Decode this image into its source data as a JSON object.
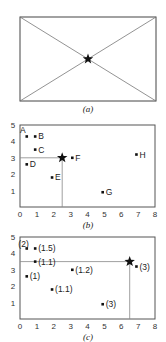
{
  "panels": {
    "a": {
      "caption": "(a)",
      "description": "Rectangle with both diagonals; star at intersection (centroid)"
    },
    "b": {
      "caption": "(b)",
      "x_ticks": [
        "0",
        "1",
        "2",
        "3",
        "4",
        "5",
        "6",
        "7",
        "8"
      ],
      "y_ticks": [
        "1",
        "2",
        "3",
        "4",
        "5"
      ],
      "points": [
        {
          "label": "A",
          "x": 0.4,
          "y": 4.3
        },
        {
          "label": "B",
          "x": 0.9,
          "y": 4.3
        },
        {
          "label": "C",
          "x": 0.9,
          "y": 3.5
        },
        {
          "label": "D",
          "x": 0.4,
          "y": 2.6
        },
        {
          "label": "E",
          "x": 1.9,
          "y": 1.8
        },
        {
          "label": "F",
          "x": 3.1,
          "y": 3.0
        },
        {
          "label": "G",
          "x": 4.9,
          "y": 0.9
        },
        {
          "label": "H",
          "x": 6.9,
          "y": 3.2
        }
      ],
      "star": {
        "x": 2.5,
        "y": 3.0
      }
    },
    "c": {
      "caption": "(c)",
      "x_ticks": [
        "0",
        "1",
        "2",
        "3",
        "4",
        "5",
        "6",
        "7",
        "8"
      ],
      "y_ticks": [
        "1",
        "2",
        "3",
        "4",
        "5"
      ],
      "points": [
        {
          "label": "(2)",
          "x": 0.4,
          "y": 4.3
        },
        {
          "label": "(1.5)",
          "x": 0.9,
          "y": 4.3
        },
        {
          "label": "(1.1)",
          "x": 0.9,
          "y": 3.5
        },
        {
          "label": "(1)",
          "x": 0.4,
          "y": 2.6
        },
        {
          "label": "(1.1)",
          "x": 1.9,
          "y": 1.8
        },
        {
          "label": "(1.2)",
          "x": 3.1,
          "y": 3.0
        },
        {
          "label": "(3)",
          "x": 4.9,
          "y": 0.9
        },
        {
          "label": "(3)",
          "x": 6.9,
          "y": 3.2
        }
      ],
      "star": {
        "x": 6.5,
        "y": 3.5
      }
    }
  }
}
